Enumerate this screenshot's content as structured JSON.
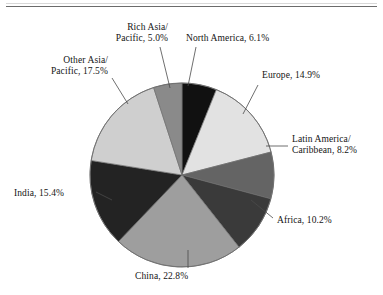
{
  "chart_data": {
    "type": "pie",
    "title": "",
    "subtitle": "",
    "xlabel": "",
    "ylabel": "",
    "legend_position": "none",
    "grid": false,
    "label_format": "{name}, {value}%",
    "start_angle_deg": 0,
    "direction": "clockwise",
    "categories": [
      "North America",
      "Europe",
      "Latin America/\nCaribbean",
      "Africa",
      "China",
      "India",
      "Other Asia/\nPacific",
      "Rich Asia/\nPacific"
    ],
    "values": [
      6.1,
      14.9,
      8.2,
      10.2,
      22.8,
      15.4,
      17.5,
      5.0
    ],
    "colors": [
      "#111111",
      "#e2e2e2",
      "#646464",
      "#3a3a3a",
      "#9e9e9e",
      "#232323",
      "#cfcfcf",
      "#8a8a8a"
    ],
    "slices": [
      {
        "name": "North America",
        "value": 6.1,
        "label": "North America, 6.1%",
        "color": "#111111"
      },
      {
        "name": "Europe",
        "value": 14.9,
        "label": "Europe, 14.9%",
        "color": "#e2e2e2"
      },
      {
        "name": "Latin America/Caribbean",
        "value": 8.2,
        "label": "Latin America/\nCaribbean, 8.2%",
        "color": "#646464"
      },
      {
        "name": "Africa",
        "value": 10.2,
        "label": "Africa, 10.2%",
        "color": "#3a3a3a"
      },
      {
        "name": "China",
        "value": 22.8,
        "label": "China, 22.8%",
        "color": "#9e9e9e"
      },
      {
        "name": "India",
        "value": 15.4,
        "label": "India, 15.4%",
        "color": "#232323"
      },
      {
        "name": "Other Asia/Pacific",
        "value": 17.5,
        "label": "Other Asia/\nPacific, 17.5%",
        "color": "#cfcfcf"
      },
      {
        "name": "Rich Asia/Pacific",
        "value": 5.0,
        "label": "Rich Asia/\nPacific, 5.0%",
        "color": "#8a8a8a"
      }
    ],
    "total": 100.1,
    "units": "percent"
  },
  "labels": {
    "north_america": "North America, 6.1%",
    "europe": "Europe, 14.9%",
    "latin_america": "Latin America/\nCaribbean, 8.2%",
    "africa": "Africa, 10.2%",
    "china": "China, 22.8%",
    "india": "India, 15.4%",
    "other_asia": "Other Asia/\nPacific, 17.5%",
    "rich_asia": "Rich Asia/\nPacific, 5.0%"
  },
  "style": {
    "background": "#ffffff",
    "text_color": "#141414",
    "outline_color": "#6e6e6e",
    "leader_color": "#4a4a4a",
    "rule_color": "#6b6b6b"
  }
}
